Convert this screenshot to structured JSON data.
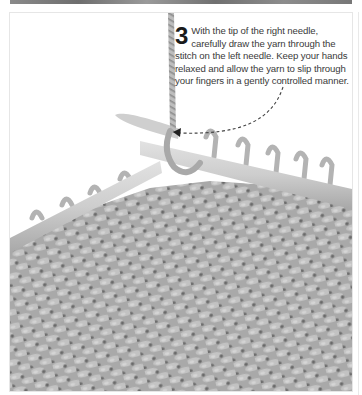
{
  "step": {
    "number": "3",
    "text": "With the tip of the right needle, carefully draw the yarn through the stitch on the left needle. Keep your hands relaxed and allow the yarn to slip through your fingers in a gently controlled manner."
  },
  "illustration": {
    "subject": "knitting-photo",
    "arrow": "dashed-curved-arrow",
    "colors": {
      "yarn": "#b5b5b5",
      "needle": "#cfcfcf",
      "fabric_shadow": "#7a7a7a",
      "background": "#ffffff",
      "text": "#3a3a3a"
    }
  }
}
